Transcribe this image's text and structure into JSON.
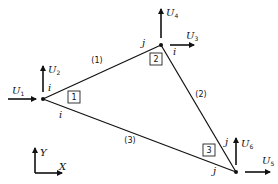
{
  "diagram": {
    "type": "finite-element-truss",
    "nodes": [
      {
        "id": "1",
        "label": "1",
        "x": 43,
        "y": 99
      },
      {
        "id": "2",
        "label": "2",
        "x": 161,
        "y": 45
      },
      {
        "id": "3",
        "label": "3",
        "x": 236,
        "y": 172
      }
    ],
    "elements": [
      {
        "id": "(1)",
        "label": "(1)",
        "from": "1",
        "to": "2",
        "end_i": "i",
        "end_j": "j"
      },
      {
        "id": "(2)",
        "label": "(2)",
        "from": "2",
        "to": "3",
        "end_i": "i",
        "end_j": "j"
      },
      {
        "id": "(3)",
        "label": "(3)",
        "from": "1",
        "to": "3",
        "end_i": "i",
        "end_j": "j"
      }
    ],
    "dofs": [
      {
        "name": "U",
        "sub": "1",
        "node": "1",
        "direction": "x"
      },
      {
        "name": "U",
        "sub": "2",
        "node": "1",
        "direction": "y"
      },
      {
        "name": "U",
        "sub": "3",
        "node": "2",
        "direction": "x"
      },
      {
        "name": "U",
        "sub": "4",
        "node": "2",
        "direction": "y"
      },
      {
        "name": "U",
        "sub": "5",
        "node": "3",
        "direction": "x"
      },
      {
        "name": "U",
        "sub": "6",
        "node": "3",
        "direction": "y"
      }
    ],
    "end_labels": {
      "i": "i",
      "j": "j"
    },
    "axes": {
      "x_label": "X",
      "y_label": "Y"
    }
  }
}
